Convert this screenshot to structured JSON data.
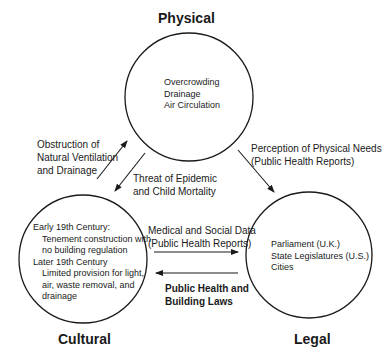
{
  "nodes": {
    "physical": {
      "title": "Physical",
      "items": [
        "Overcrowding",
        "Drainage",
        "Air Circulation"
      ]
    },
    "cultural": {
      "title": "Cultural",
      "items": [
        {
          "heading": "Early 19th Century:",
          "lines": [
            "Tenement construction with",
            "no building regulation"
          ]
        },
        {
          "heading": "Later 19th Century",
          "lines": [
            "Limited provision for light,",
            "air, waste removal, and",
            "drainage"
          ]
        }
      ]
    },
    "legal": {
      "title": "Legal",
      "items": [
        "Parliament (U.K.)",
        "State Legislatures (U.S.)",
        "Cities"
      ]
    }
  },
  "edges": {
    "cultural_to_physical": [
      "Obstruction of",
      "Natural Ventilation",
      "and Drainage"
    ],
    "physical_to_cultural": [
      "Threat of Epidemic",
      "and Child Mortality"
    ],
    "physical_to_legal": [
      "Perception of Physical Needs",
      "(Public Health Reports)"
    ],
    "cultural_to_legal": [
      "Medical and Social Data",
      "(Public Health Reports)"
    ],
    "legal_to_cultural": [
      "Public Health and",
      "Building Laws"
    ]
  }
}
